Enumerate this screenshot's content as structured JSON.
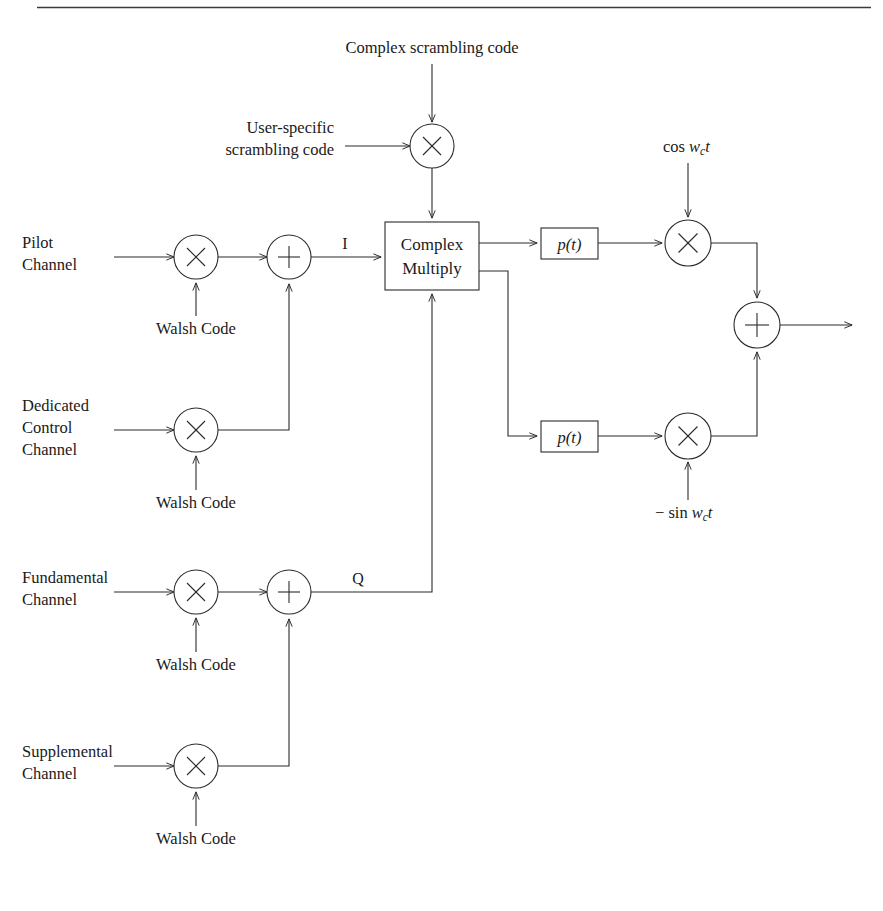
{
  "figure": {
    "kind": "block-diagram",
    "title_visible": false,
    "top_rule": true,
    "background_color": "#ffffff",
    "line_color": "#2b2b2b"
  },
  "labels": {
    "complex_scrambling_code": "Complex  scrambling code",
    "user_specific_line1": "User-specific",
    "user_specific_line2": "scrambling code",
    "pilot_line1": "Pilot",
    "pilot_line2": "Channel",
    "dedicated_line1": "Dedicated",
    "dedicated_line2": "Control",
    "dedicated_line3": "Channel",
    "fundamental_line1": "Fundamental",
    "fundamental_line2": "Channel",
    "supplemental_line1": "Supplemental",
    "supplemental_line2": "Channel",
    "walsh_code": "Walsh Code",
    "complex_multiply_line1": "Complex",
    "complex_multiply_line2": "Multiply",
    "i_branch": "I",
    "q_branch": "Q",
    "pulse_shape": "p(t)",
    "carrier_cos_prefix": "cos",
    "carrier_cos_w": "w",
    "carrier_cos_sub": "c",
    "carrier_cos_t": "t",
    "carrier_sin_prefix": "− sin",
    "carrier_sin_w": "w",
    "carrier_sin_sub": "c",
    "carrier_sin_t": "t"
  },
  "nodes": {
    "multiplier_glyph": "×",
    "adder_glyph": "+",
    "walsh_multipliers": [
      {
        "name": "pilot-walsh-multiplier",
        "cx": 196,
        "cy": 257
      },
      {
        "name": "dedicated-walsh-multiplier",
        "cx": 196,
        "cy": 430
      },
      {
        "name": "fundamental-walsh-multiplier",
        "cx": 196,
        "cy": 592
      },
      {
        "name": "supplemental-walsh-multiplier",
        "cx": 196,
        "cy": 766
      }
    ],
    "adders": [
      {
        "name": "i-branch-adder",
        "cx": 289,
        "cy": 257
      },
      {
        "name": "q-branch-adder",
        "cx": 289,
        "cy": 592
      },
      {
        "name": "output-adder",
        "cx": 757,
        "cy": 325
      }
    ],
    "carrier_multipliers": [
      {
        "name": "i-carrier-multiplier",
        "cx": 688,
        "cy": 243
      },
      {
        "name": "q-carrier-multiplier",
        "cx": 688,
        "cy": 436
      }
    ],
    "scrambling_multiplier": {
      "name": "scrambling-multiplier",
      "cx": 432,
      "cy": 146
    }
  },
  "blocks": {
    "complex_multiply": {
      "x": 385,
      "y": 222,
      "w": 94,
      "h": 68
    },
    "pulse_top": {
      "x": 541,
      "y": 228,
      "w": 57,
      "h": 31
    },
    "pulse_bottom": {
      "x": 541,
      "y": 421,
      "w": 57,
      "h": 31
    }
  },
  "walsh_positions": [
    {
      "name": "walsh-label-pilot",
      "x": 196,
      "y": 328
    },
    {
      "name": "walsh-label-dedicated",
      "x": 196,
      "y": 502
    },
    {
      "name": "walsh-label-fundamental",
      "x": 196,
      "y": 664
    },
    {
      "name": "walsh-label-supplemental",
      "x": 196,
      "y": 838
    }
  ]
}
